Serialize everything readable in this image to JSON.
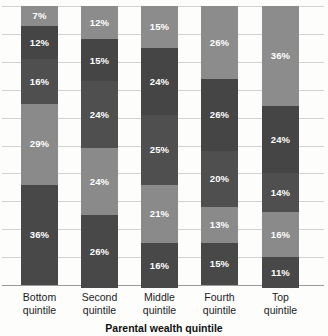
{
  "chart_data": {
    "type": "bar",
    "stacked": true,
    "stack_mode": "percent",
    "title": "",
    "subtitle": "",
    "xlabel": "Parental wealth quintile",
    "ylabel": "",
    "ylim": [
      0,
      100
    ],
    "grid": true,
    "legend": "none",
    "categories": [
      "Bottom quintile",
      "Second quintile",
      "Middle quintile",
      "Fourth quintile",
      "Top quintile"
    ],
    "category_lines": [
      [
        "Bottom",
        "quintile"
      ],
      [
        "Second",
        "quintile"
      ],
      [
        "Middle",
        "quintile"
      ],
      [
        "Fourth",
        "quintile"
      ],
      [
        "Top",
        "quintile"
      ]
    ],
    "series": [
      {
        "name": "Top quintile",
        "color": "#8c8c8c",
        "values": [
          7,
          12,
          15,
          26,
          36
        ],
        "labels": [
          "7%",
          "12%",
          "15%",
          "26%",
          "36%"
        ]
      },
      {
        "name": "Fourth quintile",
        "color": "#454545",
        "values": [
          12,
          15,
          24,
          26,
          24
        ],
        "labels": [
          "12%",
          "15%",
          "24%",
          "26%",
          "24%"
        ]
      },
      {
        "name": "Middle quintile",
        "color": "#4f4f4f",
        "values": [
          16,
          24,
          25,
          20,
          14
        ],
        "labels": [
          "16%",
          "24%",
          "25%",
          "20%",
          "14%"
        ]
      },
      {
        "name": "Second quintile",
        "color": "#8a8a8a",
        "values": [
          29,
          24,
          21,
          13,
          16
        ],
        "labels": [
          "29%",
          "24%",
          "21%",
          "13%",
          "16%"
        ]
      },
      {
        "name": "Bottom quintile",
        "color": "#484848",
        "values": [
          36,
          26,
          16,
          15,
          11
        ],
        "labels": [
          "36%",
          "26%",
          "16%",
          "15%",
          "11%"
        ]
      }
    ],
    "gridline_count": 10,
    "colors": {
      "grid": "#d2d2d0",
      "axis": "#9a9a98",
      "background": "#fdfdfc",
      "label_text": "#ffffff",
      "axis_text": "#1b1b1b"
    }
  }
}
